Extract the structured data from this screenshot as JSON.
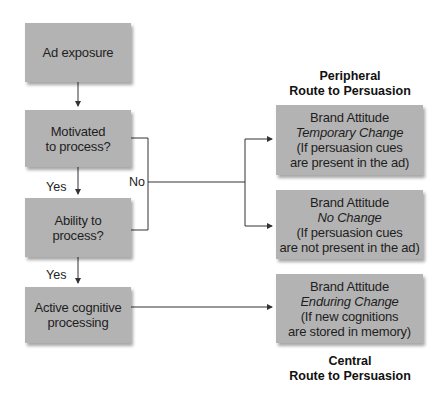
{
  "left_flow": {
    "ad_exposure": "Ad exposure",
    "motivated": [
      "Motivated",
      "to process?"
    ],
    "ability": [
      "Ability to",
      "process?"
    ],
    "active": [
      "Active cognitive",
      "processing"
    ],
    "yes_label_1": "Yes",
    "yes_label_2": "Yes",
    "no_label": "No"
  },
  "right_outcomes": {
    "peripheral_route": [
      "Peripheral",
      "Route to Persuasion"
    ],
    "temporary": {
      "title": "Brand Attitude",
      "change": "Temporary Change",
      "note": [
        "(If persuasion cues",
        "are present in the ad)"
      ]
    },
    "no_change": {
      "title": "Brand Attitude",
      "change": "No Change",
      "note": [
        "(If persuasion cues",
        "are not present in the ad)"
      ]
    },
    "enduring": {
      "title": "Brand Attitude",
      "change": "Enduring Change",
      "note": [
        "(If new cognitions",
        "are stored in memory)"
      ]
    },
    "central_route": [
      "Central",
      "Route to Persuasion"
    ]
  },
  "colors": {
    "box_fill": "#b3b3b3",
    "line": "#333333",
    "background": "#ffffff"
  }
}
